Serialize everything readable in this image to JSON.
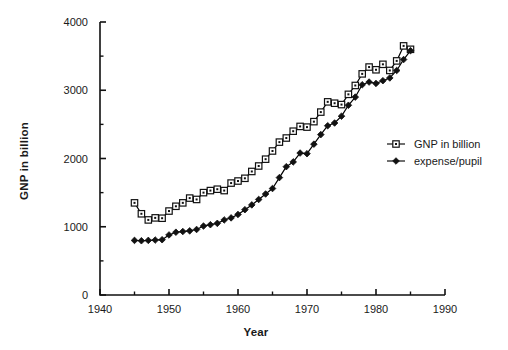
{
  "chart_data": {
    "type": "line",
    "title": "",
    "xlabel": "Year",
    "ylabel": "GNP in billion",
    "xlim": [
      1940,
      1990
    ],
    "ylim": [
      0,
      4000
    ],
    "xticks": [
      1940,
      1950,
      1960,
      1970,
      1980,
      1990
    ],
    "xtick_labels": [
      "1940",
      "1950",
      "1960",
      "1970",
      "1980",
      "1990"
    ],
    "x_minor_ticks": [
      1945,
      1955,
      1965,
      1975,
      1985
    ],
    "yticks": [
      0,
      1000,
      2000,
      3000,
      4000
    ],
    "ytick_labels": [
      "0",
      "1000",
      "2000",
      "3000",
      "4000"
    ],
    "y_minor_ticks": [
      500,
      1500,
      2500,
      3500
    ],
    "grid": false,
    "legend_position": "right",
    "series": [
      {
        "name": "GNP in billion",
        "marker": "open-square",
        "color": "#000000",
        "x": [
          1945,
          1946,
          1947,
          1948,
          1949,
          1950,
          1951,
          1952,
          1953,
          1954,
          1955,
          1956,
          1957,
          1958,
          1959,
          1960,
          1961,
          1962,
          1963,
          1964,
          1965,
          1966,
          1967,
          1968,
          1969,
          1970,
          1971,
          1972,
          1973,
          1974,
          1975,
          1976,
          1977,
          1978,
          1979,
          1980,
          1981,
          1982,
          1983,
          1984,
          1985
        ],
        "values": [
          1350,
          1190,
          1100,
          1130,
          1125,
          1230,
          1300,
          1350,
          1420,
          1400,
          1500,
          1530,
          1550,
          1530,
          1640,
          1670,
          1710,
          1810,
          1890,
          1990,
          2110,
          2240,
          2300,
          2400,
          2470,
          2460,
          2540,
          2680,
          2830,
          2810,
          2790,
          2940,
          3070,
          3240,
          3340,
          3300,
          3380,
          3290,
          3430,
          3650,
          3600
        ]
      },
      {
        "name": "expense/pupil",
        "marker": "filled-diamond",
        "color": "#000000",
        "x": [
          1945,
          1946,
          1947,
          1948,
          1949,
          1950,
          1951,
          1952,
          1953,
          1954,
          1955,
          1956,
          1957,
          1958,
          1959,
          1960,
          1961,
          1962,
          1963,
          1964,
          1965,
          1966,
          1967,
          1968,
          1969,
          1970,
          1971,
          1972,
          1973,
          1974,
          1975,
          1976,
          1977,
          1978,
          1979,
          1980,
          1981,
          1982,
          1983,
          1984,
          1985
        ],
        "values": [
          800,
          795,
          800,
          805,
          810,
          880,
          920,
          930,
          940,
          960,
          1010,
          1030,
          1050,
          1100,
          1130,
          1180,
          1250,
          1320,
          1400,
          1480,
          1560,
          1720,
          1880,
          1950,
          2080,
          2070,
          2210,
          2350,
          2480,
          2520,
          2620,
          2780,
          2900,
          3080,
          3120,
          3100,
          3140,
          3180,
          3290,
          3450,
          3580
        ]
      }
    ],
    "legend": [
      {
        "label": "GNP in billion",
        "marker": "open-square"
      },
      {
        "label": "expense/pupil",
        "marker": "filled-diamond"
      }
    ]
  },
  "axis_geometry": {
    "plot_left": 100,
    "plot_right": 445,
    "plot_top": 22,
    "plot_bottom": 295
  },
  "legend_geometry": {
    "marker_x": 396,
    "label_x": 414,
    "row_y": [
      144,
      161
    ]
  }
}
